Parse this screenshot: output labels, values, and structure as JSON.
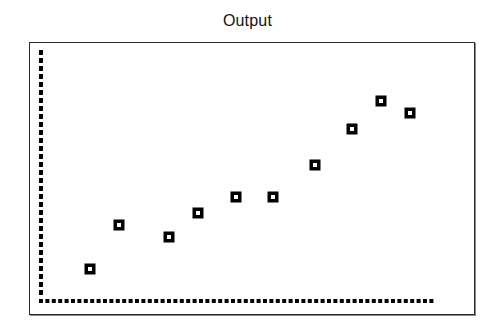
{
  "chart_data": {
    "type": "scatter",
    "title": "Output",
    "xlabel": "",
    "ylabel": "",
    "grid": false,
    "legend": null,
    "marker": "hollow-square",
    "marker_color": "#000000",
    "axes_style": "dashed",
    "x": [
      1,
      2,
      3,
      4,
      5,
      6,
      7,
      8,
      9,
      10
    ],
    "y": [
      1.0,
      2.6,
      2.2,
      3.0,
      3.6,
      3.6,
      4.8,
      6.0,
      7.0,
      6.6
    ],
    "pixel_positions": [
      [
        90,
        269
      ],
      [
        119,
        225
      ],
      [
        169,
        237
      ],
      [
        198,
        213
      ],
      [
        236,
        197
      ],
      [
        273,
        197
      ],
      [
        315,
        165
      ],
      [
        352,
        129
      ],
      [
        381,
        101
      ],
      [
        410,
        113
      ]
    ]
  },
  "header": {
    "title": "Output"
  },
  "colors": {
    "background": "#ffffff",
    "frame": "#2a2a2a",
    "marker": "#000000",
    "axis": "#000000"
  }
}
